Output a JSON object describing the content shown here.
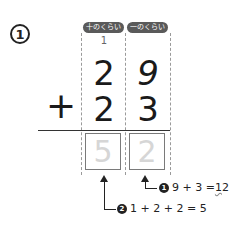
{
  "problem": {
    "number": "1",
    "place_labels": [
      "十のくらい",
      "一のくらい"
    ],
    "carry_mark": "1",
    "top_number": [
      "2",
      "9"
    ],
    "operator": "+",
    "bottom_number": [
      "2",
      "3"
    ],
    "answer": [
      "5",
      "2"
    ]
  },
  "steps": [
    {
      "badge": "1",
      "expr": "9 + 3 = ",
      "result_tens": "1",
      "result_ones": "2"
    },
    {
      "badge": "2",
      "expr": "1 + 2 + 2 = 5"
    }
  ]
}
